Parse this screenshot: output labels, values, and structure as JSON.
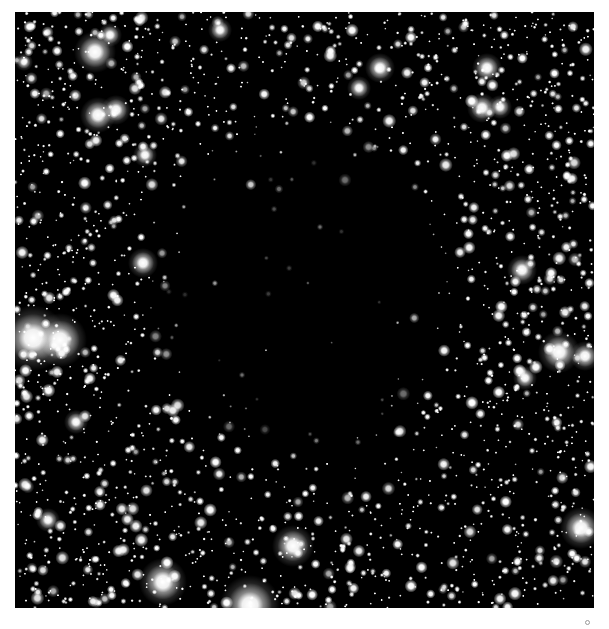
{
  "image": {
    "subject": "dark-nebula-starfield",
    "frame": {
      "x": 15,
      "y": 12,
      "width": 579,
      "height": 596
    },
    "background_color": "#000000",
    "page_background": "#ffffff",
    "star_color": "#ffffff",
    "dark_cloud": {
      "cx": 300,
      "cy": 290,
      "rx": 215,
      "ry": 245
    },
    "bright_stars": [
      {
        "x": 95,
        "y": 52,
        "r": 7
      },
      {
        "x": 110,
        "y": 35,
        "r": 4
      },
      {
        "x": 98,
        "y": 115,
        "r": 6
      },
      {
        "x": 116,
        "y": 110,
        "r": 5
      },
      {
        "x": 145,
        "y": 155,
        "r": 4
      },
      {
        "x": 143,
        "y": 263,
        "r": 5
      },
      {
        "x": 33,
        "y": 338,
        "r": 11
      },
      {
        "x": 60,
        "y": 340,
        "r": 9
      },
      {
        "x": 76,
        "y": 422,
        "r": 4
      },
      {
        "x": 48,
        "y": 520,
        "r": 4
      },
      {
        "x": 163,
        "y": 582,
        "r": 8
      },
      {
        "x": 293,
        "y": 546,
        "r": 7
      },
      {
        "x": 250,
        "y": 605,
        "r": 10
      },
      {
        "x": 380,
        "y": 68,
        "r": 5
      },
      {
        "x": 359,
        "y": 88,
        "r": 4
      },
      {
        "x": 487,
        "y": 68,
        "r": 5
      },
      {
        "x": 482,
        "y": 108,
        "r": 5
      },
      {
        "x": 500,
        "y": 107,
        "r": 4
      },
      {
        "x": 522,
        "y": 270,
        "r": 5
      },
      {
        "x": 559,
        "y": 352,
        "r": 7
      },
      {
        "x": 525,
        "y": 378,
        "r": 4
      },
      {
        "x": 581,
        "y": 528,
        "r": 7
      },
      {
        "x": 220,
        "y": 30,
        "r": 4
      },
      {
        "x": 24,
        "y": 62,
        "r": 3
      },
      {
        "x": 585,
        "y": 356,
        "r": 5
      }
    ],
    "faint_stars_in_cloud": [
      {
        "x": 345,
        "y": 180,
        "r": 3
      },
      {
        "x": 279,
        "y": 189,
        "r": 2
      },
      {
        "x": 320,
        "y": 227,
        "r": 1.5
      },
      {
        "x": 242,
        "y": 375,
        "r": 1.5
      }
    ]
  },
  "marker": {
    "shape": "circle",
    "x": 588,
    "y": 623
  }
}
